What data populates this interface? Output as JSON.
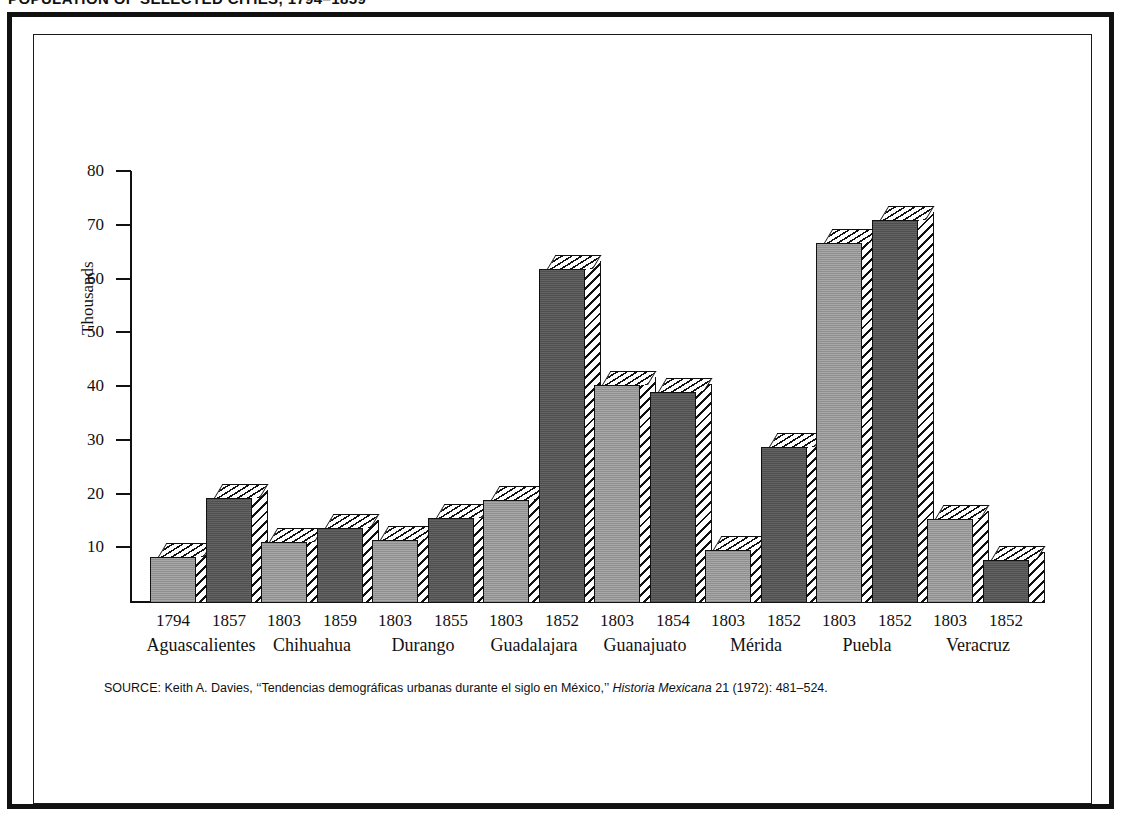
{
  "running_head": "POPULATION OF SELECTED CITIES, 1794–1859",
  "chart_data": {
    "type": "bar",
    "title": "",
    "xlabel": "",
    "ylabel": "Thousands",
    "ylim": [
      0,
      80
    ],
    "yticks": [
      10,
      20,
      30,
      40,
      50,
      60,
      70,
      80
    ],
    "grid": false,
    "legend": "none",
    "categories": [
      "Aguascalientes",
      "Chihuahua",
      "Durango",
      "Guadalajara",
      "Guanajuato",
      "Mérida",
      "Puebla",
      "Veracruz"
    ],
    "groups": [
      {
        "city": "Aguascalientes",
        "bars": [
          {
            "year": "1794",
            "value": 8.5,
            "shade": "light"
          },
          {
            "year": "1857",
            "value": 19.5,
            "shade": "dark"
          }
        ]
      },
      {
        "city": "Chihuahua",
        "bars": [
          {
            "year": "1803",
            "value": 11.3,
            "shade": "light"
          },
          {
            "year": "1859",
            "value": 14.0,
            "shade": "dark"
          }
        ]
      },
      {
        "city": "Durango",
        "bars": [
          {
            "year": "1803",
            "value": 11.8,
            "shade": "light"
          },
          {
            "year": "1855",
            "value": 15.8,
            "shade": "dark"
          }
        ]
      },
      {
        "city": "Guadalajara",
        "bars": [
          {
            "year": "1803",
            "value": 19.2,
            "shade": "light"
          },
          {
            "year": "1852",
            "value": 62.2,
            "shade": "dark"
          }
        ]
      },
      {
        "city": "Guanajuato",
        "bars": [
          {
            "year": "1803",
            "value": 40.6,
            "shade": "light"
          },
          {
            "year": "1854",
            "value": 39.2,
            "shade": "dark"
          }
        ]
      },
      {
        "city": "Mérida",
        "bars": [
          {
            "year": "1803",
            "value": 9.8,
            "shade": "light"
          },
          {
            "year": "1852",
            "value": 29.0,
            "shade": "dark"
          }
        ]
      },
      {
        "city": "Puebla",
        "bars": [
          {
            "year": "1803",
            "value": 67.0,
            "shade": "light"
          },
          {
            "year": "1852",
            "value": 71.3,
            "shade": "dark"
          }
        ]
      },
      {
        "city": "Veracruz",
        "bars": [
          {
            "year": "1803",
            "value": 15.6,
            "shade": "light"
          },
          {
            "year": "1852",
            "value": 8.0,
            "shade": "dark"
          }
        ]
      }
    ],
    "colors": {
      "light_bar": "#9e9e9e",
      "dark_bar": "#585858",
      "outline": "#111111",
      "background": "#ffffff"
    }
  },
  "source": {
    "label": "SOURCE:",
    "text_before_italic": " Keith A. Davies, ‘‘Tendencias demográficas urbanas durante el siglo en México,’’ ",
    "italic": "Historia Mexicana",
    "text_after_italic": " 21 (1972): 481–524."
  }
}
